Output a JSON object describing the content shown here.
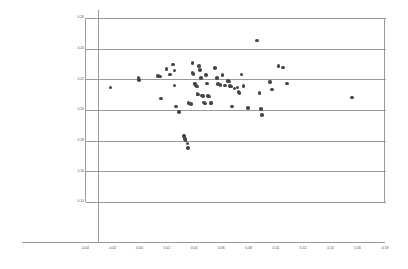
{
  "chart_data": {
    "type": "scatter",
    "title": "",
    "subtitle": "",
    "xlabel": "",
    "ylabel": "",
    "xlim": [
      -0.04,
      0.18
    ],
    "ylim": [
      0.14,
      0.26
    ],
    "xticks": [
      -0.04,
      -0.02,
      0.0,
      0.02,
      0.04,
      0.06,
      0.08,
      0.1,
      0.12,
      0.14,
      0.16,
      0.18
    ],
    "xtick_labels": [
      "-0.04",
      "-0.02",
      "0.00",
      "0.02",
      "0.04",
      "0.06",
      "0.08",
      "0.10",
      "0.12",
      "0.14",
      "0.16",
      "0.18"
    ],
    "yticks": [
      0.26,
      0.24,
      0.22,
      0.2,
      0.18,
      0.16,
      0.14
    ],
    "ytick_labels": [
      "0.26",
      "0.24",
      "0.22",
      "0.20",
      "0.18",
      "0.16",
      "0.14"
    ],
    "grid": "horizontal",
    "legend": "none",
    "marker": {
      "shape": "circle",
      "color": "#474747",
      "size_px": 3.6
    },
    "series": [
      {
        "name": "series-1",
        "color": "#474747",
        "points": [
          [
            -0.022,
            0.2148
          ],
          [
            -0.0015,
            0.221
          ],
          [
            -0.001,
            0.2196
          ],
          [
            0.013,
            0.2222
          ],
          [
            0.0142,
            0.2218
          ],
          [
            0.0152,
            0.2075
          ],
          [
            0.019,
            0.2266
          ],
          [
            0.0215,
            0.2232
          ],
          [
            0.0238,
            0.2296
          ],
          [
            0.0248,
            0.2258
          ],
          [
            0.025,
            0.216
          ],
          [
            0.0262,
            0.2022
          ],
          [
            0.0282,
            0.1986
          ],
          [
            0.0318,
            0.1835
          ],
          [
            0.032,
            0.1828
          ],
          [
            0.0325,
            0.1812
          ],
          [
            0.033,
            0.18
          ],
          [
            0.0345,
            0.1782
          ],
          [
            0.0348,
            0.1752
          ],
          [
            0.0352,
            0.2044
          ],
          [
            0.0368,
            0.204
          ],
          [
            0.038,
            0.2308
          ],
          [
            0.0382,
            0.224
          ],
          [
            0.0388,
            0.2236
          ],
          [
            0.0395,
            0.2172
          ],
          [
            0.04,
            0.2168
          ],
          [
            0.0405,
            0.216
          ],
          [
            0.0412,
            0.2152
          ],
          [
            0.0418,
            0.2104
          ],
          [
            0.0422,
            0.21
          ],
          [
            0.0428,
            0.2286
          ],
          [
            0.0438,
            0.2262
          ],
          [
            0.0445,
            0.221
          ],
          [
            0.0452,
            0.2095
          ],
          [
            0.0458,
            0.209
          ],
          [
            0.0465,
            0.2048
          ],
          [
            0.0472,
            0.2042
          ],
          [
            0.048,
            0.2228
          ],
          [
            0.0488,
            0.2172
          ],
          [
            0.0495,
            0.209
          ],
          [
            0.0505,
            0.2088
          ],
          [
            0.0512,
            0.2046
          ],
          [
            0.052,
            0.2044
          ],
          [
            0.0548,
            0.2272
          ],
          [
            0.0562,
            0.2208
          ],
          [
            0.057,
            0.2168
          ],
          [
            0.0585,
            0.2162
          ],
          [
            0.0602,
            0.2228
          ],
          [
            0.0618,
            0.216
          ],
          [
            0.064,
            0.219
          ],
          [
            0.0648,
            0.2186
          ],
          [
            0.0655,
            0.2158
          ],
          [
            0.0665,
            0.2152
          ],
          [
            0.0672,
            0.2022
          ],
          [
            0.069,
            0.214
          ],
          [
            0.071,
            0.2148
          ],
          [
            0.0718,
            0.2118
          ],
          [
            0.0725,
            0.2112
          ],
          [
            0.074,
            0.2232
          ],
          [
            0.0755,
            0.2158
          ],
          [
            0.079,
            0.2012
          ],
          [
            0.0852,
            0.2452
          ],
          [
            0.0872,
            0.211
          ],
          [
            0.0885,
            0.2008
          ],
          [
            0.089,
            0.1968
          ],
          [
            0.0948,
            0.2182
          ],
          [
            0.0962,
            0.2135
          ],
          [
            0.1012,
            0.2288
          ],
          [
            0.1045,
            0.2276
          ],
          [
            0.1075,
            0.2172
          ],
          [
            0.1552,
            0.2082
          ]
        ]
      }
    ]
  }
}
